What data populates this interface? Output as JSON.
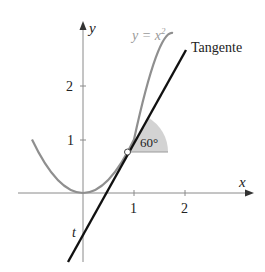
{
  "figure": {
    "y_axis_label": "y",
    "x_axis_label": "x",
    "curve_label": "y = x²",
    "curve_label_base": "y = x",
    "curve_label_exp": "2",
    "tangent_label": "Tangente",
    "intercept_label": "t",
    "angle_label": "60°",
    "x_ticks": [
      "1",
      "2"
    ],
    "y_ticks": [
      "1",
      "2"
    ],
    "colors": {
      "axis": "#8a8a8a",
      "curve": "#8f8f8f",
      "tangent": "#111111",
      "angle_fill": "#d3d3d3",
      "text": "#222222",
      "curve_label": "#9a9a9a"
    }
  }
}
